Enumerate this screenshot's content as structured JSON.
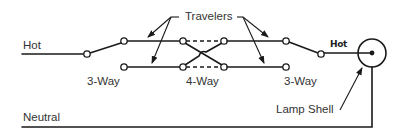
{
  "diagram": {
    "labels": {
      "hot": "Hot",
      "neutral": "Neutral",
      "travelers": "Travelers",
      "left_switch": "3-Way",
      "middle_switch": "4-Way",
      "right_switch": "3-Way",
      "lamp_shell": "Lamp Shell",
      "handwritten_hot": "Hot"
    },
    "components": [
      {
        "id": "left-3way",
        "type": "3-way switch",
        "label": "3-Way"
      },
      {
        "id": "middle-4way",
        "type": "4-way switch",
        "label": "4-Way"
      },
      {
        "id": "right-3way",
        "type": "3-way switch",
        "label": "3-Way"
      },
      {
        "id": "lamp",
        "type": "lamp",
        "label": "Lamp Shell"
      }
    ],
    "connections": [
      {
        "from": "Hot",
        "to": "left-3way"
      },
      {
        "from": "left-3way",
        "to": "middle-4way",
        "via": "Travelers"
      },
      {
        "from": "middle-4way",
        "to": "right-3way",
        "via": "Travelers"
      },
      {
        "from": "right-3way",
        "to": "lamp",
        "label": "Hot"
      },
      {
        "from": "lamp",
        "to": "Neutral"
      }
    ],
    "colors": {
      "line": "#1a1a1a",
      "text": "#333333",
      "background": "#ffffff"
    }
  }
}
